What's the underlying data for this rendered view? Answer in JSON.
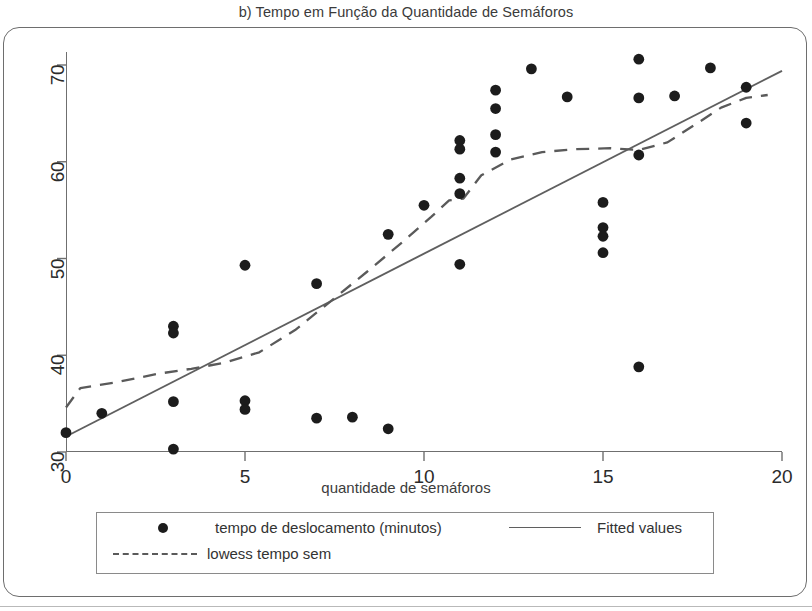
{
  "chart_data": {
    "type": "scatter",
    "title": "b) Tempo em Função da Quantidade de Semáforos",
    "xlabel": "quantidade de semáforos",
    "ylabel": "",
    "xlim": [
      0,
      20
    ],
    "ylim": [
      30,
      70
    ],
    "xticks": [
      0,
      5,
      10,
      15,
      20
    ],
    "yticks": [
      30,
      40,
      50,
      60,
      70
    ],
    "xtick_labels": [
      "0",
      "5",
      "10",
      "15",
      "20"
    ],
    "ytick_labels": [
      "30",
      "40",
      "50",
      "60",
      "70"
    ],
    "grid": false,
    "legend_position": "bottom",
    "series": [
      {
        "name": "tempo de deslocamento (minutos)",
        "type": "scatter",
        "marker": "filled-circle",
        "color": "#1c1c1c",
        "points": [
          {
            "x": 0,
            "y": 32.0
          },
          {
            "x": 1,
            "y": 34.0
          },
          {
            "x": 3,
            "y": 43.0
          },
          {
            "x": 3,
            "y": 42.3
          },
          {
            "x": 3,
            "y": 35.2
          },
          {
            "x": 3,
            "y": 30.3
          },
          {
            "x": 5,
            "y": 49.3
          },
          {
            "x": 5,
            "y": 35.3
          },
          {
            "x": 5,
            "y": 34.4
          },
          {
            "x": 7,
            "y": 47.4
          },
          {
            "x": 7,
            "y": 33.5
          },
          {
            "x": 8,
            "y": 33.6
          },
          {
            "x": 9,
            "y": 52.5
          },
          {
            "x": 9,
            "y": 32.4
          },
          {
            "x": 10,
            "y": 55.5
          },
          {
            "x": 11,
            "y": 62.2
          },
          {
            "x": 11,
            "y": 61.3
          },
          {
            "x": 11,
            "y": 58.3
          },
          {
            "x": 11,
            "y": 56.7
          },
          {
            "x": 11,
            "y": 49.4
          },
          {
            "x": 12,
            "y": 67.4
          },
          {
            "x": 12,
            "y": 65.5
          },
          {
            "x": 12,
            "y": 62.8
          },
          {
            "x": 12,
            "y": 61.0
          },
          {
            "x": 13,
            "y": 69.6
          },
          {
            "x": 14,
            "y": 66.7
          },
          {
            "x": 15,
            "y": 55.8
          },
          {
            "x": 15,
            "y": 53.2
          },
          {
            "x": 15,
            "y": 52.3
          },
          {
            "x": 15,
            "y": 50.6
          },
          {
            "x": 16,
            "y": 70.6
          },
          {
            "x": 16,
            "y": 66.6
          },
          {
            "x": 16,
            "y": 60.7
          },
          {
            "x": 16,
            "y": 38.8
          },
          {
            "x": 17,
            "y": 66.8
          },
          {
            "x": 18,
            "y": 69.7
          },
          {
            "x": 19,
            "y": 67.7
          },
          {
            "x": 19,
            "y": 64.0
          }
        ]
      },
      {
        "name": "Fitted values",
        "type": "line",
        "style": "solid",
        "color": "#5f5f5f",
        "points": [
          {
            "x": 0,
            "y": 31.6
          },
          {
            "x": 20,
            "y": 69.4
          }
        ]
      },
      {
        "name": "lowess tempo sem",
        "type": "line",
        "style": "dashed",
        "color": "#5a5a5a",
        "points": [
          {
            "x": 0.0,
            "y": 34.6
          },
          {
            "x": 0.4,
            "y": 36.6
          },
          {
            "x": 1.4,
            "y": 37.2
          },
          {
            "x": 2.6,
            "y": 38.1
          },
          {
            "x": 3.5,
            "y": 38.6
          },
          {
            "x": 4.4,
            "y": 39.2
          },
          {
            "x": 5.4,
            "y": 40.3
          },
          {
            "x": 6.4,
            "y": 42.6
          },
          {
            "x": 7.4,
            "y": 45.6
          },
          {
            "x": 8.4,
            "y": 48.6
          },
          {
            "x": 9.4,
            "y": 51.7
          },
          {
            "x": 10.2,
            "y": 54.3
          },
          {
            "x": 10.7,
            "y": 56.0
          },
          {
            "x": 11.1,
            "y": 56.2
          },
          {
            "x": 11.6,
            "y": 58.6
          },
          {
            "x": 12.4,
            "y": 60.2
          },
          {
            "x": 13.3,
            "y": 61.0
          },
          {
            "x": 14.2,
            "y": 61.3
          },
          {
            "x": 15.2,
            "y": 61.4
          },
          {
            "x": 16.0,
            "y": 61.2
          },
          {
            "x": 16.8,
            "y": 62.0
          },
          {
            "x": 17.6,
            "y": 63.9
          },
          {
            "x": 18.3,
            "y": 65.6
          },
          {
            "x": 19.0,
            "y": 66.6
          },
          {
            "x": 19.6,
            "y": 66.9
          }
        ]
      }
    ]
  },
  "legend": {
    "points_label": "tempo de deslocamento (minutos)",
    "fitted_label": "Fitted values",
    "lowess_label": "lowess tempo sem"
  },
  "icons": {
    "point_marker": "filled-circle-icon",
    "solid_line": "solid-line-icon",
    "dashed_line": "dashed-line-icon"
  }
}
